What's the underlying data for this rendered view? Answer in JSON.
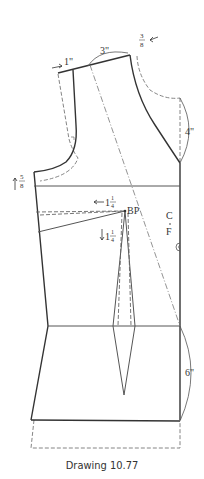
{
  "caption": "Drawing 10.77",
  "labels": {
    "shoulder_shift": "1\"",
    "neck_width": "3\"",
    "neck_offset_num": "3",
    "neck_offset_den": "8",
    "armhole_raise_num": "5",
    "armhole_raise_den": "8",
    "neck_depth": "4\"",
    "dart_shift_whole": "1",
    "dart_shift_num": "1",
    "dart_shift_den": "4",
    "dart_drop_whole": "1",
    "dart_drop_num": "1",
    "dart_drop_den": "4",
    "bust_point": "BP",
    "center_front_c": "C",
    "center_front_f": "F",
    "hem_length": "6\""
  },
  "colors": {
    "line": "#333333",
    "thin": "#555555",
    "dash": "#777777"
  }
}
